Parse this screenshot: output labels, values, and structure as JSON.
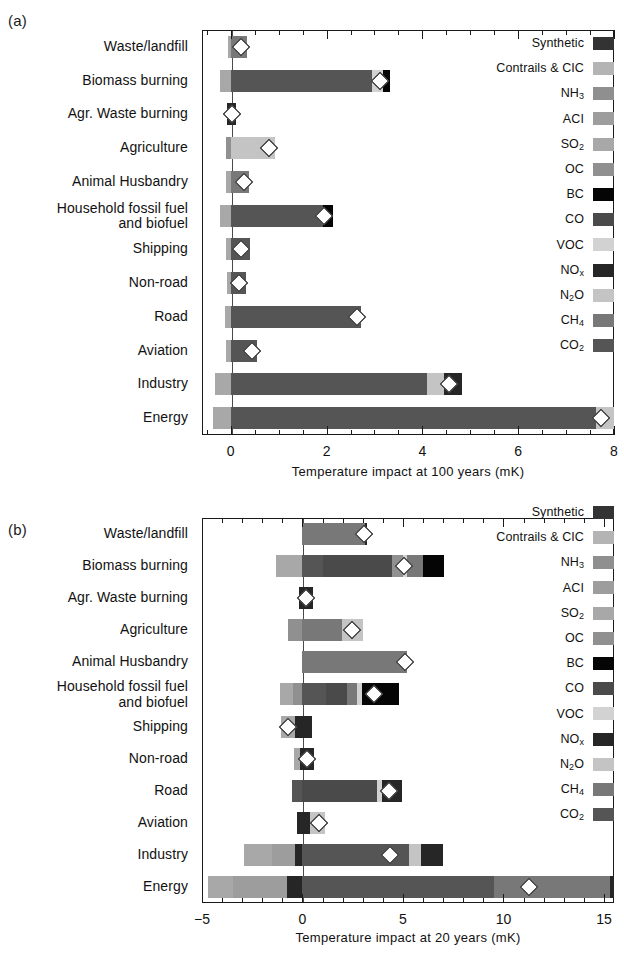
{
  "figure": {
    "panels": [
      {
        "tag": "(a)",
        "xlabel": "Temperature impact at 100 years (mK)",
        "xticks": [
          "0",
          "2",
          "4",
          "6",
          "8"
        ]
      },
      {
        "tag": "(b)",
        "xlabel": "Temperature impact at 20 years (mK)",
        "xticks": [
          "-5",
          "0",
          "5",
          "10",
          "15"
        ]
      }
    ]
  },
  "legend": {
    "items": [
      {
        "label": "Synthetic",
        "key": "Synthetic",
        "color": "#333333"
      },
      {
        "label": "Contrails & CIC",
        "key": "Contrails & CIC",
        "color": "#b4b4b4"
      },
      {
        "label": "NH3",
        "key": "NH3",
        "color": "#8f8f8f"
      },
      {
        "label": "ACI",
        "key": "ACI",
        "color": "#9d9d9d"
      },
      {
        "label": "SO2",
        "key": "SO2",
        "color": "#a8a8a8"
      },
      {
        "label": "OC",
        "key": "OC",
        "color": "#909090"
      },
      {
        "label": "BC",
        "key": "BC",
        "color": "#050505"
      },
      {
        "label": "CO",
        "key": "CO",
        "color": "#4a4a4a"
      },
      {
        "label": "VOC",
        "key": "VOC",
        "color": "#d2d2d2"
      },
      {
        "label": "NOx",
        "key": "NOx",
        "color": "#262626"
      },
      {
        "label": "N2O",
        "key": "N2O",
        "color": "#c4c4c4"
      },
      {
        "label": "CH4",
        "key": "CH4",
        "color": "#787878"
      },
      {
        "label": "CO2",
        "key": "CO2",
        "color": "#555555"
      }
    ]
  },
  "chart_data": [
    {
      "type": "bar",
      "orientation": "horizontal",
      "stacked": true,
      "panel": "a",
      "title": "",
      "xlabel": "Temperature impact at 100 years (mK)",
      "ylabel": "",
      "xlim": [
        -0.6,
        8.0
      ],
      "xticks": [
        0,
        2,
        4,
        6,
        8
      ],
      "grid": false,
      "legend_position": "inside-right",
      "marker": "net total (white diamond)",
      "categories": [
        "Waste/landfill",
        "Biomass burning",
        "Agr. Waste burning",
        "Agriculture",
        "Animal Husbandry",
        "Household fossil fuel and biofuel",
        "Shipping",
        "Non-road",
        "Road",
        "Aviation",
        "Industry",
        "Energy"
      ],
      "bars": [
        {
          "category": "Waste/landfill",
          "net": 0.22,
          "segments": [
            {
              "species": "SO2",
              "from": -0.06,
              "to": 0.0
            },
            {
              "species": "CH4",
              "from": 0.0,
              "to": 0.33
            }
          ]
        },
        {
          "category": "Biomass burning",
          "net": 3.12,
          "segments": [
            {
              "species": "SO2",
              "from": -0.22,
              "to": 0.0
            },
            {
              "species": "CO2",
              "from": 0.0,
              "to": 2.95
            },
            {
              "species": "VOC",
              "from": 2.95,
              "to": 3.17
            },
            {
              "species": "BC",
              "from": 3.17,
              "to": 3.32
            }
          ]
        },
        {
          "category": "Agr. Waste burning",
          "net": 0.03,
          "segments": [
            {
              "species": "NOx",
              "from": -0.07,
              "to": 0.1
            }
          ]
        },
        {
          "category": "Agriculture",
          "net": 0.8,
          "segments": [
            {
              "species": "OC",
              "from": -0.1,
              "to": 0.0
            },
            {
              "species": "N2O",
              "from": 0.0,
              "to": 0.92
            }
          ]
        },
        {
          "category": "Animal Husbandry",
          "net": 0.28,
          "segments": [
            {
              "species": "SO2",
              "from": -0.09,
              "to": 0.0
            },
            {
              "species": "CH4",
              "from": 0.0,
              "to": 0.38
            }
          ]
        },
        {
          "category": "Household fossil fuel and biofuel",
          "net": 1.95,
          "segments": [
            {
              "species": "SO2",
              "from": -0.22,
              "to": 0.0
            },
            {
              "species": "CO2",
              "from": 0.0,
              "to": 1.92
            },
            {
              "species": "BC",
              "from": 1.92,
              "to": 2.14
            }
          ]
        },
        {
          "category": "Shipping",
          "net": 0.21,
          "segments": [
            {
              "species": "SO2",
              "from": -0.09,
              "to": 0.0
            },
            {
              "species": "CO2",
              "from": 0.0,
              "to": 0.4
            }
          ]
        },
        {
          "category": "Non-road",
          "net": 0.17,
          "segments": [
            {
              "species": "SO2",
              "from": -0.07,
              "to": 0.0
            },
            {
              "species": "CO2",
              "from": 0.0,
              "to": 0.32
            }
          ]
        },
        {
          "category": "Road",
          "net": 2.63,
          "segments": [
            {
              "species": "SO2",
              "from": -0.13,
              "to": 0.0
            },
            {
              "species": "CO2",
              "from": 0.0,
              "to": 2.72
            }
          ]
        },
        {
          "category": "Aviation",
          "net": 0.44,
          "segments": [
            {
              "species": "SO2",
              "from": -0.09,
              "to": 0.0
            },
            {
              "species": "CO2",
              "from": 0.0,
              "to": 0.55
            }
          ]
        },
        {
          "category": "Industry",
          "net": 4.55,
          "segments": [
            {
              "species": "SO2",
              "from": -0.32,
              "to": 0.0
            },
            {
              "species": "CO2",
              "from": 0.0,
              "to": 4.1
            },
            {
              "species": "N2O",
              "from": 4.1,
              "to": 4.45
            },
            {
              "species": "NOx",
              "from": 4.45,
              "to": 4.82
            }
          ]
        },
        {
          "category": "Energy",
          "net": 7.72,
          "segments": [
            {
              "species": "SO2",
              "from": -0.38,
              "to": 0.0
            },
            {
              "species": "CO2",
              "from": 0.0,
              "to": 7.62
            },
            {
              "species": "N2O",
              "from": 7.62,
              "to": 8.0
            }
          ]
        }
      ]
    },
    {
      "type": "bar",
      "orientation": "horizontal",
      "stacked": true,
      "panel": "b",
      "title": "",
      "xlabel": "Temperature impact at 20 years (mK)",
      "ylabel": "",
      "xlim": [
        -5.0,
        15.5
      ],
      "xticks": [
        -5,
        0,
        5,
        10,
        15
      ],
      "grid": false,
      "legend_position": "inside-right",
      "marker": "net total (white diamond)",
      "categories": [
        "Waste/landfill",
        "Biomass burning",
        "Agr. Waste burning",
        "Agriculture",
        "Animal Husbandry",
        "Household fossil fuel and biofuel",
        "Shipping",
        "Non-road",
        "Road",
        "Aviation",
        "Industry",
        "Energy"
      ],
      "bars": [
        {
          "category": "Waste/landfill",
          "net": 3.05,
          "segments": [
            {
              "species": "CH4",
              "from": 0.0,
              "to": 3.1
            },
            {
              "species": "NOx",
              "from": 3.1,
              "to": 3.22
            }
          ]
        },
        {
          "category": "Biomass burning",
          "net": 5.05,
          "segments": [
            {
              "species": "SO2",
              "from": -1.3,
              "to": 0.0
            },
            {
              "species": "CO2",
              "from": 0.0,
              "to": 1.0
            },
            {
              "species": "CO",
              "from": 1.0,
              "to": 4.45
            },
            {
              "species": "OC",
              "from": 4.45,
              "to": 5.0
            },
            {
              "species": "VOC",
              "from": 5.0,
              "to": 5.2
            },
            {
              "species": "CH4",
              "from": 5.2,
              "to": 6.0
            },
            {
              "species": "BC",
              "from": 6.0,
              "to": 7.05
            }
          ]
        },
        {
          "category": "Agr. Waste burning",
          "net": 0.15,
          "segments": [
            {
              "species": "NOx",
              "from": -0.18,
              "to": 0.5
            }
          ]
        },
        {
          "category": "Agriculture",
          "net": 2.45,
          "segments": [
            {
              "species": "OC",
              "from": -0.7,
              "to": 0.0
            },
            {
              "species": "CH4",
              "from": 0.0,
              "to": 1.95
            },
            {
              "species": "N2O",
              "from": 1.95,
              "to": 3.0
            }
          ]
        },
        {
          "category": "Animal Husbandry",
          "net": 5.1,
          "segments": [
            {
              "species": "CH4",
              "from": 0.0,
              "to": 5.2
            }
          ]
        },
        {
          "category": "Household fossil fuel and biofuel",
          "net": 3.55,
          "segments": [
            {
              "species": "SO2",
              "from": -1.1,
              "to": -0.45
            },
            {
              "species": "OC",
              "from": -0.45,
              "to": 0.0
            },
            {
              "species": "CO2",
              "from": 0.0,
              "to": 1.15
            },
            {
              "species": "CO",
              "from": 1.15,
              "to": 2.2
            },
            {
              "species": "CH4",
              "from": 2.2,
              "to": 2.7
            },
            {
              "species": "VOC",
              "from": 2.7,
              "to": 2.95
            },
            {
              "species": "BC",
              "from": 2.95,
              "to": 4.8
            }
          ]
        },
        {
          "category": "Shipping",
          "net": -0.7,
          "segments": [
            {
              "species": "SO2",
              "from": -1.05,
              "to": -0.35
            },
            {
              "species": "NOx",
              "from": -0.35,
              "to": 0.45
            }
          ]
        },
        {
          "category": "Non-road",
          "net": 0.2,
          "segments": [
            {
              "species": "SO2",
              "from": -0.4,
              "to": -0.1
            },
            {
              "species": "NOx",
              "from": -0.1,
              "to": 0.55
            }
          ]
        },
        {
          "category": "Road",
          "net": 4.3,
          "segments": [
            {
              "species": "CO2",
              "from": -0.5,
              "to": 0.0
            },
            {
              "species": "CO",
              "from": 0.0,
              "to": 3.7
            },
            {
              "species": "VOC",
              "from": 3.7,
              "to": 3.95
            },
            {
              "species": "NOx",
              "from": 3.95,
              "to": 4.95
            }
          ]
        },
        {
          "category": "Aviation",
          "net": 0.8,
          "segments": [
            {
              "species": "NOx",
              "from": -0.25,
              "to": 0.35
            },
            {
              "species": "N2O",
              "from": 0.35,
              "to": 1.1
            }
          ]
        },
        {
          "category": "Industry",
          "net": 4.35,
          "segments": [
            {
              "species": "SO2",
              "from": -2.9,
              "to": -1.5
            },
            {
              "species": "ACI",
              "from": -1.5,
              "to": -0.35
            },
            {
              "species": "NOx",
              "from": -0.35,
              "to": 0.0
            },
            {
              "species": "CO2",
              "from": 0.0,
              "to": 5.3
            },
            {
              "species": "N2O",
              "from": 5.3,
              "to": 5.9
            },
            {
              "species": "NOx2",
              "from": 5.9,
              "to": 7.0
            }
          ]
        },
        {
          "category": "Energy",
          "net": 11.25,
          "segments": [
            {
              "species": "SO2",
              "from": -4.7,
              "to": -3.45
            },
            {
              "species": "ACI",
              "from": -3.45,
              "to": -0.75
            },
            {
              "species": "NOx",
              "from": -0.75,
              "to": 0.0
            },
            {
              "species": "CO2",
              "from": 0.0,
              "to": 9.55
            },
            {
              "species": "CH4",
              "from": 9.55,
              "to": 15.3
            },
            {
              "species": "NOx2",
              "from": 15.3,
              "to": 15.5
            }
          ]
        }
      ]
    }
  ]
}
